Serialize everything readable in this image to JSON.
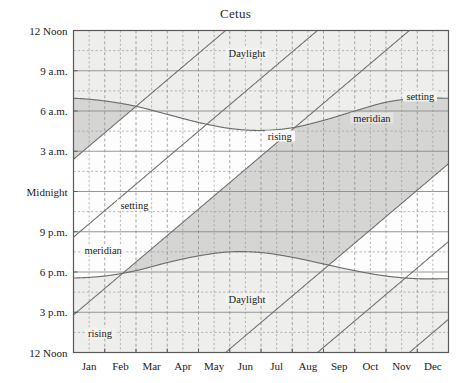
{
  "chart_data": {
    "type": "line",
    "title": "Cetus",
    "xlabel": "",
    "ylabel": "",
    "grid": true,
    "legend": "none",
    "categories": [
      "Jan",
      "Feb",
      "Mar",
      "Apr",
      "May",
      "Jun",
      "Jul",
      "Aug",
      "Sep",
      "Oct",
      "Nov",
      "Dec"
    ],
    "x_tick_labels": [
      "Jan",
      "Feb",
      "Mar",
      "Apr",
      "May",
      "Jun",
      "Jul",
      "Aug",
      "Sep",
      "Oct",
      "Nov",
      "Dec"
    ],
    "y_tick_labels": [
      "12 Noon",
      "9 a.m.",
      "6 a.m.",
      "3 a.m.",
      "Midnight",
      "9 p.m.",
      "6 p.m.",
      "3 p.m.",
      "12 Noon"
    ],
    "y_tick_hours": [
      0,
      3,
      6,
      9,
      12,
      15,
      18,
      21,
      24
    ],
    "ylim_hours_from_noon": [
      0,
      24
    ],
    "xlim_months": [
      0,
      12
    ],
    "minor_grid_hours": 1.5,
    "minor_grid_months": 0.5,
    "series": [
      {
        "name": "rising",
        "label": "rising",
        "kind": "diagonal",
        "slope_hours_per_month": -1.9726,
        "value_at_jan1_hours_from_noon": 9.6
      },
      {
        "name": "meridian",
        "label": "meridian",
        "kind": "diagonal",
        "slope_hours_per_month": -1.9726,
        "value_at_jan1_hours_from_noon": 15.4
      },
      {
        "name": "setting",
        "label": "setting",
        "kind": "diagonal",
        "slope_hours_per_month": -1.9726,
        "value_at_jan1_hours_from_noon": 21.2
      },
      {
        "name": "sunrise-dawn-curve",
        "label": "dawn",
        "kind": "curve",
        "x_months": [
          0,
          1,
          2,
          3,
          4,
          5,
          6,
          7,
          8,
          9,
          10,
          11,
          12
        ],
        "y_hours_from_noon": [
          18.45,
          18.3,
          17.9,
          17.3,
          16.8,
          16.5,
          16.55,
          16.9,
          17.4,
          17.9,
          18.3,
          18.5,
          18.5
        ]
      },
      {
        "name": "sunset-dusk-curve",
        "label": "dusk",
        "kind": "curve",
        "x_months": [
          0,
          1,
          2,
          3,
          4,
          5,
          6,
          7,
          8,
          9,
          10,
          11,
          12
        ],
        "y_hours_from_noon": [
          5.05,
          5.25,
          5.65,
          6.25,
          6.85,
          7.3,
          7.45,
          7.25,
          6.7,
          6.0,
          5.35,
          5.05,
          5.05
        ]
      }
    ],
    "regions": [
      {
        "name": "daylight-upper",
        "label": "Daylight",
        "fill": "#eeeeec"
      },
      {
        "name": "daylight-lower",
        "label": "Daylight",
        "fill": "#eeeeec"
      },
      {
        "name": "night",
        "label": "",
        "fill": "#d5d5d3"
      },
      {
        "name": "object-up-at-night",
        "label": "",
        "fill": "#fdfdfd"
      }
    ],
    "annotations": [
      {
        "name": "daylight-top",
        "text": "Daylight",
        "x_month": 5.55,
        "y_hours_from_noon": 1.65
      },
      {
        "name": "setting-right",
        "text": "setting",
        "x_month": 11.1,
        "y_hours_from_noon": 4.85
      },
      {
        "name": "meridian-right",
        "text": "meridian",
        "x_month": 9.55,
        "y_hours_from_noon": 6.55
      },
      {
        "name": "rising-middle",
        "text": "rising",
        "x_month": 6.6,
        "y_hours_from_noon": 7.9
      },
      {
        "name": "setting-left",
        "text": "setting",
        "x_month": 1.95,
        "y_hours_from_noon": 13.0
      },
      {
        "name": "meridian-left",
        "text": "meridian",
        "x_month": 0.95,
        "y_hours_from_noon": 16.35
      },
      {
        "name": "daylight-bottom",
        "text": "Daylight",
        "x_month": 5.55,
        "y_hours_from_noon": 20.0
      },
      {
        "name": "rising-bottom",
        "text": "rising",
        "x_month": 0.85,
        "y_hours_from_noon": 22.55
      }
    ],
    "colors": {
      "daylight_fill": "#eeeeec",
      "night_fill": "#d5d5d3",
      "open_fill": "#fdfdfd",
      "line": "#6e6e6e",
      "major_grid": "#8a8a8a",
      "minor_grid": "#9a9a9a",
      "axis": "#5a5a5a",
      "text": "#1a1a1a"
    }
  }
}
